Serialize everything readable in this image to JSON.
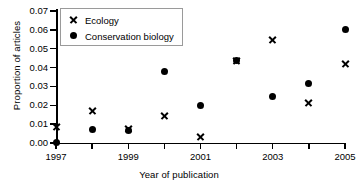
{
  "chart_data": {
    "type": "scatter",
    "title": "",
    "xlabel": "Year of publication",
    "ylabel": "Proportion of articles",
    "x": [
      1997,
      1998,
      1999,
      2000,
      2001,
      2002,
      2003,
      2004,
      2005
    ],
    "xlim": [
      1997,
      2005
    ],
    "ylim": [
      0.0,
      0.07
    ],
    "xticks": [
      1997,
      1998,
      1999,
      2000,
      2001,
      2002,
      2003,
      2004,
      2005
    ],
    "xticklabels": [
      "1997",
      "",
      "1999",
      "",
      "2001",
      "",
      "2003",
      "",
      "2005"
    ],
    "yticks": [
      0.0,
      0.01,
      0.02,
      0.03,
      0.04,
      0.05,
      0.06,
      0.07
    ],
    "yticklabels": [
      "0.00",
      "0.01",
      "0.02",
      "0.03",
      "0.04",
      "0.05",
      "0.06",
      "0.07"
    ],
    "grid": false,
    "legend_position": "upper left",
    "series": [
      {
        "name": "Ecology",
        "marker": "x",
        "color": "#000000",
        "values": [
          0.009,
          0.017,
          0.0075,
          0.0145,
          0.0035,
          0.044,
          0.055,
          0.0216,
          0.042
        ]
      },
      {
        "name": "Conservation biology",
        "marker": "o",
        "color": "#000000",
        "values": [
          0.0002,
          0.0072,
          0.0068,
          0.038,
          0.0197,
          0.044,
          0.0249,
          0.0316,
          0.06
        ]
      }
    ]
  }
}
